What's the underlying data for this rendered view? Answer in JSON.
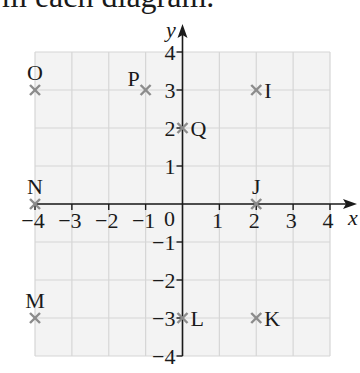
{
  "caption": "m each diagram.",
  "chart_data": {
    "type": "scatter",
    "title": "",
    "xlabel": "x",
    "ylabel": "y",
    "xlim": [
      -4,
      4
    ],
    "ylim": [
      -4,
      4
    ],
    "grid": true,
    "x_ticks": [
      "−4",
      "−3",
      "−2",
      "−1",
      "1",
      "2",
      "3",
      "4"
    ],
    "x_tick_values": [
      -4,
      -3,
      -2,
      -1,
      1,
      2,
      3,
      4
    ],
    "y_ticks": [
      "4",
      "3",
      "2",
      "1",
      "−1",
      "−2",
      "−3",
      "−4"
    ],
    "y_tick_values": [
      4,
      3,
      2,
      1,
      -1,
      -2,
      -3,
      -4
    ],
    "origin_label": "0",
    "marker": "cross",
    "colors": {
      "marker": "#8c8c8c",
      "grid": "#d6d6d6",
      "background": "#f3f3f3",
      "axis": "#1a1a1a"
    },
    "points": [
      {
        "label": "O",
        "x": -4,
        "y": 3,
        "label_pos": "above"
      },
      {
        "label": "P",
        "x": -1,
        "y": 3,
        "label_pos": "above-left"
      },
      {
        "label": "I",
        "x": 2,
        "y": 3,
        "label_pos": "right"
      },
      {
        "label": "Q",
        "x": 0,
        "y": 2,
        "label_pos": "right"
      },
      {
        "label": "N",
        "x": -4,
        "y": 0,
        "label_pos": "above"
      },
      {
        "label": "J",
        "x": 2,
        "y": 0,
        "label_pos": "above"
      },
      {
        "label": "M",
        "x": -4,
        "y": -3,
        "label_pos": "above"
      },
      {
        "label": "L",
        "x": 0,
        "y": -3,
        "label_pos": "right"
      },
      {
        "label": "K",
        "x": 2,
        "y": -3,
        "label_pos": "right"
      }
    ]
  }
}
